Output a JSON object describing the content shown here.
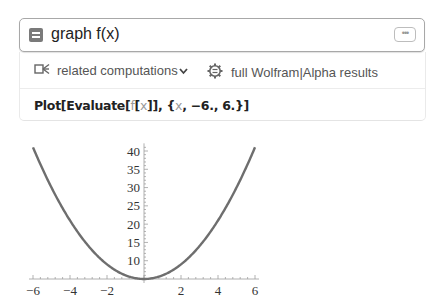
{
  "input": {
    "query": "graph f(x)",
    "more_button_label": "•••"
  },
  "toolbar": {
    "related_label": "related computations",
    "related_chevron": "⌄",
    "full_results_label": "full Wolfram|Alpha results"
  },
  "code": {
    "prefix": "Plot[Evaluate[",
    "f": "f",
    "open": "[",
    "x1": "x",
    "mid": "]], {",
    "x2": "x",
    "suffix": ", −6., 6.}]"
  },
  "chart_data": {
    "type": "line",
    "title": "",
    "xlabel": "",
    "ylabel": "",
    "x_ticks": [
      -6,
      -4,
      -2,
      2,
      4,
      6
    ],
    "y_ticks": [
      10,
      15,
      20,
      25,
      30,
      35,
      40
    ],
    "xlim": [
      -6,
      6
    ],
    "ylim": [
      5,
      41
    ],
    "axis_origin": [
      0,
      5
    ],
    "grid": false,
    "legend": null,
    "series": [
      {
        "name": "f(x)",
        "color": "#6e6e6e",
        "x": [
          -6,
          -5,
          -4,
          -3,
          -2,
          -1,
          0,
          1,
          2,
          3,
          4,
          5,
          6
        ],
        "y": [
          41,
          30,
          21,
          14,
          9,
          6,
          5,
          6,
          9,
          14,
          21,
          30,
          41
        ]
      }
    ]
  }
}
